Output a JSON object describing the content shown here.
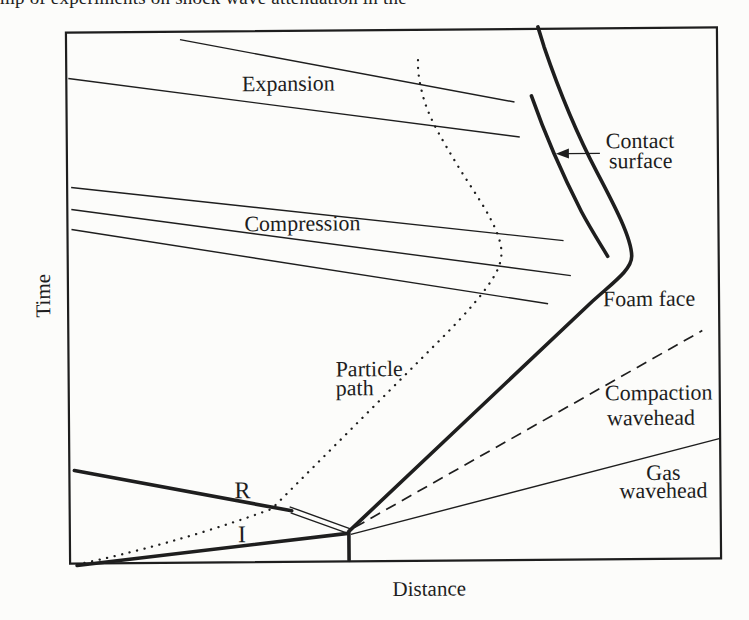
{
  "page": {
    "paper_color": "#fcfcfa",
    "ink_color": "#1e1e1e"
  },
  "cropped_top_text": {
    "fragment": "mp of experiments on shock wave attenuation in the"
  },
  "figure": {
    "type": "distance-time wave diagram",
    "x_axis_label": "Distance",
    "y_axis_label": "Time",
    "labels": {
      "expansion": "Expansion",
      "compression": "Compression",
      "contact_line1": "Contact",
      "contact_line2": "surface",
      "foam_face": "Foam face",
      "particle_line1": "Particle",
      "particle_line2": "path",
      "compaction_line1": "Compaction",
      "compaction_line2": "wavehead",
      "gas_line1": "Gas",
      "gas_line2": "wavehead",
      "reflected_shock": "R",
      "incident_shock": "I"
    }
  }
}
